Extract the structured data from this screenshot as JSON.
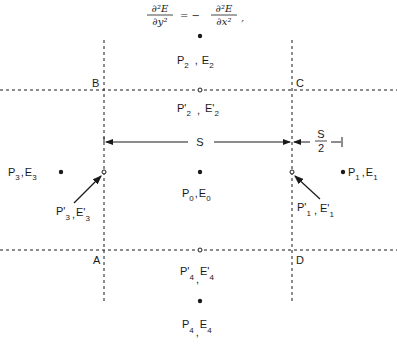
{
  "equation": {
    "lhs_num": "∂²E",
    "lhs_den": "∂y²",
    "equals": "= −",
    "rhs_num": "∂²E",
    "rhs_den": "∂x²",
    "trail": ","
  },
  "corners": {
    "A": "A",
    "B": "B",
    "C": "C",
    "D": "D"
  },
  "dimensions": {
    "spacing": "S",
    "half_num": "S",
    "half_den": "2"
  },
  "points": {
    "p0": {
      "P": "P",
      "Psub": "0",
      "sep": ",",
      "E": "E",
      "Esub": "0"
    },
    "p1": {
      "P": "P",
      "Psub": "1",
      "sep": ",",
      "E": "E",
      "Esub": "1"
    },
    "p2": {
      "P": "P",
      "Psub": "2",
      "sep": ",",
      "E": "E",
      "Esub": "2"
    },
    "p3": {
      "P": "P",
      "Psub": "3",
      "sep": ",",
      "E": "E",
      "Esub": "3"
    },
    "p4": {
      "P": "P",
      "Psub": "4",
      "sep": ",",
      "E": "E",
      "Esub": "4"
    },
    "p1p": {
      "P": "P'",
      "Psub": "1",
      "sep": ",",
      "E": "E'",
      "Esub": "1"
    },
    "p2p": {
      "P": "P'",
      "Psub": "2",
      "sep": ",",
      "E": "E'",
      "Esub": "2"
    },
    "p3p": {
      "P": "P'",
      "Psub": "3",
      "sep": ",",
      "E": "E'",
      "Esub": "3"
    },
    "p4p": {
      "P": "P'",
      "Psub": "4",
      "sep": ",",
      "E": "E'",
      "Esub": "4"
    }
  },
  "colors": {
    "ink": "#1a1a1a",
    "background": "#ffffff"
  }
}
